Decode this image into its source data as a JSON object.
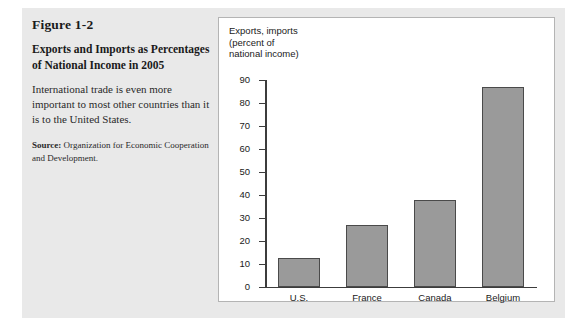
{
  "figure": {
    "number": "Figure 1-2",
    "title": "Exports and Imports as Percentages of National Income in 2005",
    "description": "International trade is even more important to most other countries than it is to the United States.",
    "source_label": "Source:",
    "source_text": "Organization for Economic Cooperation and Development."
  },
  "chart_data": {
    "type": "bar",
    "title": "Exports and Imports as Percentages of National Income in 2005",
    "categories": [
      "U.S.",
      "France",
      "Canada",
      "Belgium"
    ],
    "values": [
      12.5,
      27,
      37.5,
      87
    ],
    "xlabel": "",
    "ylabel": "Exports, imports\n(percent of\nnational income)",
    "ylim": [
      0,
      90
    ],
    "yticks": [
      0,
      10,
      20,
      30,
      40,
      50,
      60,
      70,
      80,
      90
    ],
    "ytick_labels": [
      "0",
      "10",
      "20",
      "30",
      "40",
      "50",
      "60",
      "70",
      "80",
      "90"
    ],
    "grid": false,
    "legend": false,
    "bar_color": "#9a9a9a",
    "bar_edge_color": "#4a4a4a",
    "axis_color": "#3c3c3c",
    "panel_background": "#ffffff",
    "figure_background": "#e9e9e9"
  }
}
